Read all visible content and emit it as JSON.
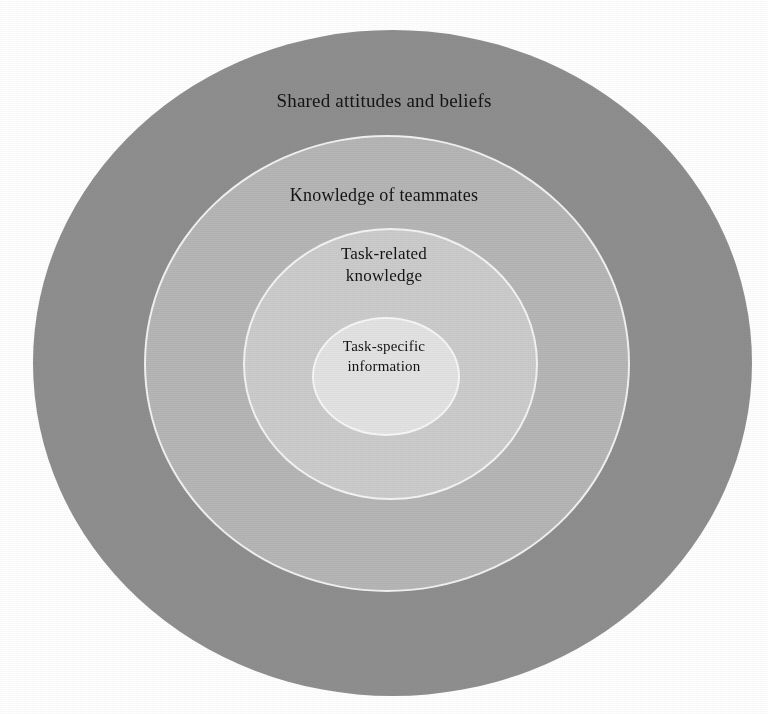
{
  "figure": {
    "type": "concentric-circle-diagram",
    "background_color": "#ffffff",
    "ring_separator_color": "#f4f4f4",
    "text_color": "#141414",
    "center": {
      "x": 392,
      "y": 363
    }
  },
  "rings": [
    {
      "id": "outer",
      "level": 1,
      "label": "Shared attitudes and beliefs",
      "fill": "#8f8f8f",
      "width": 719,
      "height": 666
    },
    {
      "id": "second",
      "level": 2,
      "label": "Knowledge of teammates",
      "fill": "#b6b6b6",
      "width": 486,
      "height": 457
    },
    {
      "id": "third",
      "level": 3,
      "label": "Task-related\nknowledge",
      "fill": "#cccccc",
      "width": 295,
      "height": 272
    },
    {
      "id": "inner",
      "level": 4,
      "label": "Task-specific\ninformation",
      "fill": "#e3e3e3",
      "width": 148,
      "height": 119
    }
  ],
  "chart_data": {
    "type": "pie",
    "title": "",
    "subtitle": "",
    "xlabel": "",
    "ylabel": "",
    "legend_position": "none",
    "grid": false,
    "categories": [
      "Shared attitudes and beliefs",
      "Knowledge of teammates",
      "Task-related knowledge",
      "Task-specific information"
    ],
    "values": [
      719,
      486,
      295,
      148
    ],
    "value_unit": "circle diameter in pixels",
    "colors": [
      "#8f8f8f",
      "#b6b6b6",
      "#cccccc",
      "#e3e3e3"
    ],
    "annotations": [
      "Shared attitudes and beliefs",
      "Knowledge of teammates",
      "Task-related knowledge",
      "Task-specific information"
    ]
  }
}
